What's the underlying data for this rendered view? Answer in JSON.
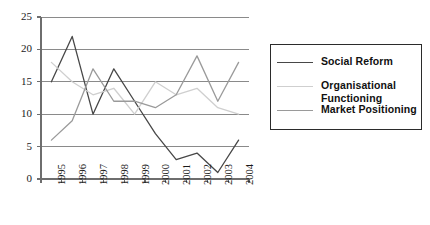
{
  "chart_data": {
    "type": "line",
    "title": "",
    "xlabel": "",
    "ylabel": "",
    "categories": [
      "1995",
      "1996",
      "1997",
      "1998",
      "1999",
      "2000",
      "2001",
      "2002",
      "2003",
      "2004"
    ],
    "ylim": [
      0,
      25
    ],
    "ytick_step": 5,
    "yticks": [
      "0",
      "5",
      "10",
      "15",
      "20",
      "25"
    ],
    "grid": "horizontal",
    "legend_position": "right",
    "series": [
      {
        "name": "Social Reform",
        "color": "#474747",
        "values": [
          15,
          22,
          10,
          17,
          12,
          7,
          3,
          4,
          1,
          6
        ]
      },
      {
        "name": "Organisational Functioning",
        "color": "#cfcfcf",
        "values": [
          18,
          15,
          13,
          14,
          10,
          15,
          13,
          14,
          11,
          10
        ]
      },
      {
        "name": "Market Positioning",
        "color": "#9a9a9a",
        "values": [
          6,
          9,
          17,
          12,
          12,
          11,
          13,
          19,
          12,
          18
        ]
      }
    ]
  },
  "legend": {
    "items": [
      {
        "label": "Social Reform"
      },
      {
        "label": "Organisational Functioning"
      },
      {
        "label": "Market Positioning"
      }
    ]
  },
  "axes": {
    "y_axis_name": "value-axis",
    "x_axis_name": "year-axis"
  }
}
